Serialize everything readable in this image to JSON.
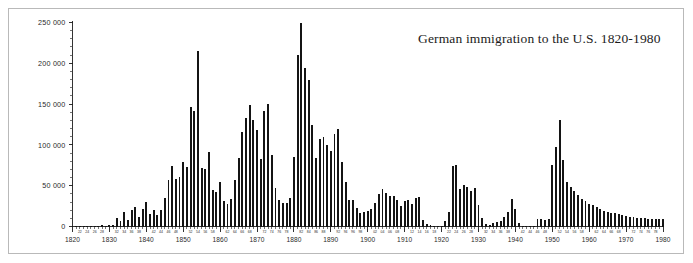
{
  "figure": {
    "title": "German immigration to the U.S. 1820-1980",
    "frame_color": "#b9b9b9",
    "background": "#ffffff",
    "bar_color": "#141414",
    "axis_color": "#1d1d1d"
  },
  "axes": {
    "y_label": "",
    "x_label": "",
    "y_ticks": [
      "0",
      "50 000",
      "100 000",
      "150 000",
      "200 000",
      "250 000"
    ],
    "y_tick_values": [
      0,
      50000,
      100000,
      150000,
      200000,
      250000
    ],
    "y_minor_step": 10000,
    "ylim": [
      0,
      250000
    ],
    "x_decade_labels": [
      "1820",
      "1830",
      "1840",
      "1850",
      "1860",
      "1870",
      "1880",
      "1890",
      "1900",
      "1910",
      "1920",
      "1930",
      "1940",
      "1950",
      "1960",
      "1970",
      "1980"
    ],
    "x_minor_label_step": 2,
    "xlim": [
      1820,
      1980
    ],
    "grid": false,
    "legend": false
  },
  "chart_data": {
    "type": "bar",
    "title": "German immigration to the U.S. 1820-1980",
    "xlabel": "",
    "ylabel": "",
    "ylim": [
      0,
      250000
    ],
    "xlim": [
      1820,
      1980
    ],
    "grid": false,
    "legend_position": "none",
    "series_name": "German immigrants admitted to the United States",
    "categories": [
      1820,
      1821,
      1822,
      1823,
      1824,
      1825,
      1826,
      1827,
      1828,
      1829,
      1830,
      1831,
      1832,
      1833,
      1834,
      1835,
      1836,
      1837,
      1838,
      1839,
      1840,
      1841,
      1842,
      1843,
      1844,
      1845,
      1846,
      1847,
      1848,
      1849,
      1850,
      1851,
      1852,
      1853,
      1854,
      1855,
      1856,
      1857,
      1858,
      1859,
      1860,
      1861,
      1862,
      1863,
      1864,
      1865,
      1866,
      1867,
      1868,
      1869,
      1870,
      1871,
      1872,
      1873,
      1874,
      1875,
      1876,
      1877,
      1878,
      1879,
      1880,
      1881,
      1882,
      1883,
      1884,
      1885,
      1886,
      1887,
      1888,
      1889,
      1890,
      1891,
      1892,
      1893,
      1894,
      1895,
      1896,
      1897,
      1898,
      1899,
      1900,
      1901,
      1902,
      1903,
      1904,
      1905,
      1906,
      1907,
      1908,
      1909,
      1910,
      1911,
      1912,
      1913,
      1914,
      1915,
      1916,
      1917,
      1918,
      1919,
      1920,
      1921,
      1922,
      1923,
      1924,
      1925,
      1926,
      1927,
      1928,
      1929,
      1930,
      1931,
      1932,
      1933,
      1934,
      1935,
      1936,
      1937,
      1938,
      1939,
      1940,
      1941,
      1942,
      1943,
      1944,
      1945,
      1946,
      1947,
      1948,
      1949,
      1950,
      1951,
      1952,
      1953,
      1954,
      1955,
      1956,
      1957,
      1958,
      1959,
      1960,
      1961,
      1962,
      1963,
      1964,
      1965,
      1966,
      1967,
      1968,
      1969,
      1970,
      1971,
      1972,
      1973,
      1974,
      1975,
      1976,
      1977,
      1978,
      1979,
      1980
    ],
    "values": [
      968,
      383,
      148,
      183,
      230,
      450,
      511,
      432,
      1851,
      597,
      1976,
      2413,
      10194,
      6988,
      17686,
      8311,
      20707,
      23740,
      11683,
      21028,
      29704,
      15291,
      20370,
      14441,
      20731,
      34355,
      57561,
      74281,
      58465,
      60235,
      78896,
      72482,
      145918,
      141946,
      215009,
      71918,
      71028,
      91781,
      45310,
      41784,
      54491,
      31661,
      27529,
      33162,
      57276,
      83424,
      115892,
      133426,
      148770,
      131042,
      118225,
      82554,
      141109,
      149671,
      87691,
      47769,
      31937,
      29298,
      29313,
      34602,
      84638,
      210485,
      250630,
      194786,
      179676,
      124443,
      84403,
      106865,
      109717,
      99538,
      92427,
      113554,
      119168,
      78756,
      53989,
      32173,
      31885,
      22533,
      17111,
      17476,
      18507,
      21651,
      28304,
      40086,
      46380,
      40574,
      37564,
      37807,
      32309,
      25540,
      31283,
      32061,
      27788,
      34329,
      35734,
      7799,
      2877,
      1857,
      425,
      52,
      1001,
      6803,
      17317,
      74273,
      75091,
      46068,
      50421,
      48513,
      43621,
      46751,
      26569,
      10100,
      2670,
      1919,
      4392,
      5201,
      6346,
      11127,
      17199,
      33515,
      21520,
      4028,
      466,
      102,
      89,
      422,
      9050,
      9100,
      8193,
      9200,
      75000,
      98000,
      130000,
      81000,
      55000,
      48000,
      44000,
      38000,
      34000,
      31000,
      28000,
      26000,
      24000,
      22000,
      19000,
      18000,
      17000,
      16000,
      15000,
      14000,
      13000,
      12000,
      11500,
      11000,
      10500,
      10000,
      9500,
      9200,
      9000,
      8800,
      8600
    ],
    "annotations": [
      {
        "year": 1882,
        "value": 250630,
        "note": "all-time peak"
      },
      {
        "year": 1854,
        "value": 215009,
        "note": "mid-century peak"
      },
      {
        "year": 1923,
        "value": 74273,
        "note": "post-WWI peak"
      },
      {
        "year": 1952,
        "value": 130000,
        "note": "post-WWII peak"
      }
    ]
  }
}
